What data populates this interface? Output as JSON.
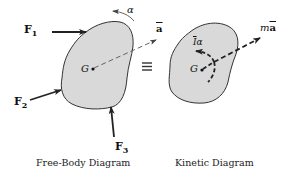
{
  "diagrams": {
    "free_body": {
      "caption": "Free-Body Diagram",
      "forces": [
        {
          "symbol": "F",
          "sub": "1"
        },
        {
          "symbol": "F",
          "sub": "2"
        },
        {
          "symbol": "F",
          "sub": "3"
        }
      ],
      "center_label": "G",
      "angular_accel_label": "α",
      "accel_label": "a"
    },
    "equivalence_symbol": "≡",
    "kinetic": {
      "caption": "Kinetic Diagram",
      "center_label": "G",
      "moment_label_I": "I",
      "moment_label_alpha": "α",
      "inertia_label_m": "m",
      "inertia_label_a": "a"
    }
  },
  "colors": {
    "body_fill": "#d9d9d9",
    "outline": "#333333",
    "arrows": "#222222"
  }
}
